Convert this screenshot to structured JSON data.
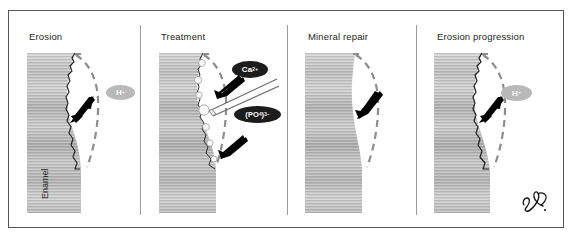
{
  "figure": {
    "kind": "scientific-diagram",
    "panel_count": 4
  },
  "panels": [
    {
      "id": "erosion",
      "title": "Erosion",
      "substrate_label": "Enamel",
      "surface": "jagged-eroded",
      "arrow_direction": "into-enamel",
      "ions": [
        {
          "id": "hydrogen-ion",
          "text": "H",
          "charge": "+",
          "style": "light"
        }
      ]
    },
    {
      "id": "treatment",
      "title": "Treatment",
      "substrate_label": "",
      "surface": "jagged-eroded-with-mineral-particles",
      "arrow_direction": "into-enamel",
      "tool": "applicator-brush",
      "particle_count": 7,
      "ions": [
        {
          "id": "calcium-ion",
          "text": "Ca",
          "charge": "2+",
          "style": "dark"
        },
        {
          "id": "phosphate-ion",
          "text": "(PO",
          "sub": "4",
          "tail": ")",
          "charge": "3−",
          "style": "dark"
        }
      ]
    },
    {
      "id": "mineral-repair",
      "title": "Mineral repair",
      "substrate_label": "",
      "surface": "smooth-repaired",
      "arrow_direction": "into-enamel",
      "ions": []
    },
    {
      "id": "erosion-progression",
      "title": "Erosion progression",
      "substrate_label": "",
      "surface": "jagged-eroded",
      "arrow_direction": "into-enamel",
      "ions": [
        {
          "id": "hydrogen-ion",
          "text": "H",
          "charge": "+",
          "style": "light"
        }
      ]
    }
  ],
  "annotations": {
    "original_contour": "dashed-outline",
    "signature": "artist-signature-monogram"
  },
  "colors": {
    "frame_border": "#555555",
    "divider": "#9a9a9a",
    "enamel_light": "#d8d8d8",
    "enamel_mid": "#b3b3b3",
    "enamel_dark": "#9a9a9a",
    "dashed_outline": "#8d8d8d",
    "arrow": "#000000",
    "ion_light_bg": "#b9b9b9",
    "ion_dark_bg": "#1c1c1c",
    "ion_text": "#ffffff",
    "title_text": "#231f20"
  }
}
